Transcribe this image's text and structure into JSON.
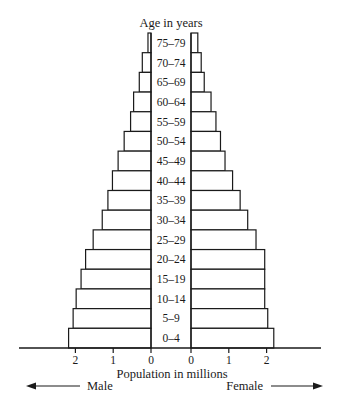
{
  "chart_data": {
    "type": "bar",
    "subtype": "population-pyramid",
    "title": "Age in years",
    "xlabel": "Population in millions",
    "ylabel": "Age in years",
    "categories": [
      "75–79",
      "70–74",
      "65–69",
      "60–64",
      "55–59",
      "50–54",
      "45–49",
      "40–44",
      "35–39",
      "30–34",
      "25–29",
      "20–24",
      "15–19",
      "10–14",
      "5–9",
      "0–4"
    ],
    "series": [
      {
        "name": "Male",
        "direction": "left",
        "values": [
          0.08,
          0.23,
          0.31,
          0.46,
          0.54,
          0.71,
          0.87,
          1.02,
          1.14,
          1.29,
          1.53,
          1.73,
          1.85,
          1.98,
          2.06,
          2.18
        ]
      },
      {
        "name": "Female",
        "direction": "right",
        "values": [
          0.18,
          0.27,
          0.35,
          0.53,
          0.66,
          0.78,
          0.9,
          1.1,
          1.3,
          1.5,
          1.72,
          1.95,
          1.95,
          1.95,
          2.03,
          2.19
        ]
      }
    ],
    "xticks_left": [
      "2",
      "1",
      "0"
    ],
    "xticks_right": [
      "0",
      "1",
      "2"
    ],
    "xlim": [
      0,
      2.5
    ],
    "grid": false,
    "legend": "none",
    "side_labels": {
      "left": "Male",
      "right": "Female"
    },
    "bar_fill": "#ffffff",
    "bar_stroke": "#1a1a1a"
  }
}
